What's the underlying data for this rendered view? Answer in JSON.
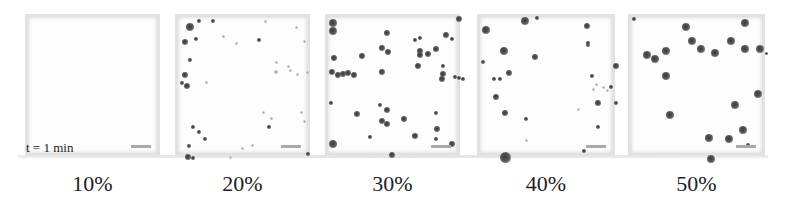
{
  "figure": {
    "time_label": "t = 1 min",
    "panels": [
      {
        "label": "10%",
        "left": 25,
        "width": 135,
        "particles": []
      },
      {
        "label": "20%",
        "left": 175,
        "width": 135,
        "particles": [
          [
            10,
            8,
            5
          ],
          [
            20,
            3,
            3
          ],
          [
            34,
            3,
            3
          ],
          [
            6,
            24,
            4
          ],
          [
            17,
            21,
            3
          ],
          [
            11,
            42,
            3
          ],
          [
            6,
            57,
            4
          ],
          [
            3,
            65,
            3
          ],
          [
            8,
            68,
            4
          ],
          [
            28,
            65,
            2,
            1
          ],
          [
            45,
            19,
            2,
            1
          ],
          [
            58,
            26,
            2,
            1
          ],
          [
            80,
            22,
            3
          ],
          [
            87,
            4,
            2,
            1
          ],
          [
            118,
            10,
            2,
            1
          ],
          [
            126,
            24,
            2,
            1
          ],
          [
            98,
            45,
            2,
            1
          ],
          [
            97,
            54,
            3,
            1
          ],
          [
            112,
            53,
            2,
            1
          ],
          [
            110,
            49,
            2,
            1
          ],
          [
            119,
            57,
            2,
            1
          ],
          [
            129,
            55,
            2,
            1
          ],
          [
            85,
            95,
            2,
            1
          ],
          [
            93,
            101,
            2,
            1
          ],
          [
            123,
            95,
            2,
            1
          ],
          [
            126,
            104,
            2,
            1
          ],
          [
            90,
            109,
            3
          ],
          [
            14,
            109,
            3
          ],
          [
            20,
            114,
            3
          ],
          [
            26,
            121,
            3
          ],
          [
            10,
            128,
            3
          ],
          [
            52,
            140,
            2,
            1
          ],
          [
            64,
            131,
            2,
            1
          ],
          [
            74,
            128,
            2,
            1
          ],
          [
            9,
            139,
            4
          ],
          [
            14,
            140,
            3
          ],
          [
            129,
            136,
            3
          ]
        ]
      },
      {
        "label": "30%",
        "left": 325,
        "width": 135,
        "particles": [
          [
            3,
            4,
            5
          ],
          [
            3,
            12,
            5
          ],
          [
            130,
            1,
            4
          ],
          [
            58,
            15,
            4
          ],
          [
            86,
            22,
            3
          ],
          [
            91,
            20,
            3
          ],
          [
            117,
            17,
            4
          ],
          [
            123,
            21,
            3
          ],
          [
            5,
            40,
            4
          ],
          [
            33,
            38,
            4
          ],
          [
            53,
            30,
            4
          ],
          [
            59,
            34,
            4
          ],
          [
            91,
            33,
            4
          ],
          [
            91,
            37,
            4
          ],
          [
            99,
            36,
            4
          ],
          [
            107,
            31,
            4
          ],
          [
            89,
            48,
            4
          ],
          [
            114,
            48,
            3
          ],
          [
            114,
            56,
            4
          ],
          [
            113,
            61,
            4
          ],
          [
            3,
            54,
            4
          ],
          [
            9,
            57,
            4
          ],
          [
            14,
            56,
            4
          ],
          [
            19,
            55,
            4
          ],
          [
            25,
            57,
            4
          ],
          [
            53,
            54,
            4
          ],
          [
            126,
            59,
            3
          ],
          [
            134,
            61,
            3
          ],
          [
            130,
            60,
            3
          ],
          [
            2,
            85,
            3
          ],
          [
            51,
            87,
            3
          ],
          [
            28,
            96,
            4
          ],
          [
            58,
            92,
            4
          ],
          [
            53,
            103,
            4
          ],
          [
            58,
            106,
            4
          ],
          [
            75,
            101,
            4
          ],
          [
            107,
            95,
            3
          ],
          [
            108,
            111,
            4
          ],
          [
            3,
            125,
            5
          ],
          [
            41,
            119,
            3
          ],
          [
            86,
            118,
            4
          ],
          [
            107,
            121,
            3
          ],
          [
            123,
            126,
            4
          ],
          [
            63,
            137,
            4
          ]
        ]
      },
      {
        "label": "40%",
        "left": 477,
        "width": 138,
        "particles": [
          [
            4,
            11,
            5
          ],
          [
            43,
            2,
            5
          ],
          [
            56,
            0,
            3
          ],
          [
            106,
            8,
            4
          ],
          [
            107,
            27,
            3
          ],
          [
            107,
            25,
            3
          ],
          [
            2,
            44,
            3
          ],
          [
            22,
            32,
            5
          ],
          [
            54,
            39,
            4
          ],
          [
            13,
            61,
            3
          ],
          [
            19,
            61,
            3
          ],
          [
            28,
            55,
            4
          ],
          [
            15,
            79,
            4
          ],
          [
            24,
            95,
            4
          ],
          [
            45,
            101,
            3
          ],
          [
            111,
            58,
            3
          ],
          [
            116,
            67,
            2,
            1
          ],
          [
            113,
            72,
            2,
            1
          ],
          [
            123,
            70,
            2,
            1
          ],
          [
            127,
            73,
            2,
            1
          ],
          [
            130,
            69,
            3
          ],
          [
            135,
            48,
            4
          ],
          [
            117,
            85,
            4
          ],
          [
            135,
            85,
            3
          ],
          [
            98,
            92,
            2,
            1
          ],
          [
            117,
            109,
            3
          ],
          [
            46,
            123,
            2,
            1
          ],
          [
            103,
            133,
            3
          ],
          [
            23,
            138,
            7
          ]
        ]
      },
      {
        "label": "50%",
        "left": 628,
        "width": 137,
        "particles": [
          [
            2,
            1,
            3
          ],
          [
            53,
            8,
            5
          ],
          [
            112,
            4,
            5
          ],
          [
            59,
            22,
            5
          ],
          [
            68,
            30,
            5
          ],
          [
            82,
            34,
            5
          ],
          [
            98,
            22,
            5
          ],
          [
            112,
            30,
            5
          ],
          [
            127,
            30,
            5
          ],
          [
            14,
            36,
            5
          ],
          [
            22,
            40,
            5
          ],
          [
            33,
            32,
            5
          ],
          [
            135,
            36,
            2
          ],
          [
            33,
            57,
            5
          ],
          [
            125,
            75,
            5
          ],
          [
            102,
            86,
            5
          ],
          [
            37,
            96,
            5
          ],
          [
            110,
            111,
            5
          ],
          [
            76,
            119,
            5
          ],
          [
            96,
            120,
            5
          ],
          [
            116,
            127,
            3
          ],
          [
            78,
            140,
            5
          ]
        ]
      }
    ]
  }
}
